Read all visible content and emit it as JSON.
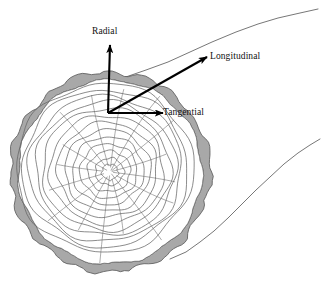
{
  "figure": {
    "width": 326,
    "height": 287,
    "background_color": "#ffffff"
  },
  "axes": {
    "origin": {
      "x": 108,
      "y": 113
    },
    "arrows": [
      {
        "id": "radial",
        "label": "Radial",
        "color": "#000000",
        "tip": {
          "x": 110,
          "y": 45
        },
        "label_position": {
          "x": 92,
          "y": 27
        }
      },
      {
        "id": "longitudinal",
        "label": "Longitudinal",
        "color": "#000000",
        "tip": {
          "x": 207,
          "y": 57
        },
        "label_position": {
          "x": 210,
          "y": 52
        }
      },
      {
        "id": "tangential",
        "label": "Tangential",
        "color": "#000000",
        "tip": {
          "x": 163,
          "y": 113
        },
        "label_position": {
          "x": 163,
          "y": 108
        }
      }
    ]
  },
  "cross_section": {
    "center": {
      "x": 110,
      "y": 172
    },
    "bark_outer_radius": 100,
    "bark_inner_radius": 92,
    "bark_fill_color": "#a8a8a8",
    "bark_outline_color": "#555555",
    "wood_fill_color": "#ffffff",
    "ring_color": "#666666",
    "ray_color": "#888888",
    "growth_ring_count": 13,
    "growth_ring_radii": [
      8,
      14,
      21,
      28,
      35,
      42,
      49,
      56,
      63,
      69,
      75,
      81,
      87
    ],
    "ray_count": 16,
    "pith_radius": 8
  },
  "trunk_edges": {
    "line_color": "#777777",
    "upper": {
      "description": "upper trunk silhouette receding to upper-right",
      "points": "96,88 120,79 146,70 168,62 190,52 212,42 236,32 258,24 278,18 300,13 318,9"
    },
    "lower": {
      "description": "lower trunk silhouette receding to upper-right",
      "points": "170,259 186,252 200,242 214,231 228,218 242,204 256,190 270,177 284,164 298,153 310,145 320,139"
    }
  }
}
